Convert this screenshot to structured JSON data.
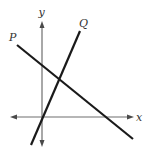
{
  "diagram": {
    "type": "coordinate-plane-lines",
    "axes": {
      "x_label": "x",
      "y_label": "y"
    },
    "lines": [
      {
        "id": "P",
        "label": "P",
        "slope_sign": "negative",
        "description": "Line P slopes downward, crossing the positive y-axis and the positive x-axis"
      },
      {
        "id": "Q",
        "label": "Q",
        "slope_sign": "positive",
        "description": "Line Q slopes upward steeply, passing near the origin"
      }
    ],
    "intersections": [
      {
        "between": [
          "P",
          "Q"
        ],
        "quadrant": "I"
      }
    ],
    "colors": {
      "axis": "#6e6e6e",
      "line": "#1a1a1a",
      "label": "#333333"
    }
  }
}
